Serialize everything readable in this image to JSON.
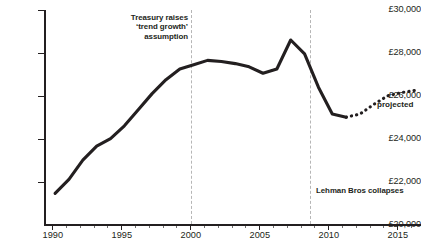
{
  "chart_data": {
    "type": "line",
    "title": "",
    "subtitle": "",
    "xlabel": "",
    "ylabel": "",
    "currency_prefix": "£",
    "xlim": [
      1989.2,
      2016.4
    ],
    "ylim": [
      20000,
      30000
    ],
    "grid": false,
    "legend": "none",
    "y_ticks": [
      {
        "value": 30000,
        "label": "£30,000"
      },
      {
        "value": 28000,
        "label": "£28,000"
      },
      {
        "value": 26000,
        "label": "£26,000"
      },
      {
        "value": 24000,
        "label": "£24,000"
      },
      {
        "value": 22000,
        "label": "£22,000"
      },
      {
        "value": 20000,
        "label": "£20,000"
      }
    ],
    "x_ticks_major": [
      {
        "value": 1990,
        "label": "1990"
      },
      {
        "value": 1995,
        "label": "1995"
      },
      {
        "value": 2000,
        "label": "2000"
      },
      {
        "value": 2005,
        "label": "2005"
      },
      {
        "value": 2010,
        "label": "2010"
      },
      {
        "value": 2015,
        "label": "2015"
      }
    ],
    "x_ticks_minor": [
      1991,
      1992,
      1993,
      1994,
      1996,
      1997,
      1998,
      1999,
      2001,
      2002,
      2003,
      2004,
      2006,
      2007,
      2008,
      2009,
      2011,
      2012,
      2013,
      2014,
      2016
    ],
    "series": [
      {
        "name": "actual",
        "style": "solid",
        "color": "#231f20",
        "x": [
          1990,
          1991,
          1992,
          1993,
          1994,
          1995,
          1996,
          1997,
          1998,
          1999,
          2000,
          2001,
          2002,
          2003,
          2004,
          2005,
          2006,
          2007,
          2008,
          2009,
          2010,
          2011
        ],
        "values": [
          21450,
          22100,
          23000,
          23650,
          24000,
          24600,
          25350,
          26100,
          26750,
          27250,
          27450,
          27650,
          27600,
          27500,
          27350,
          27050,
          27250,
          28600,
          27950,
          26400,
          25150,
          25000
        ]
      },
      {
        "name": "projected",
        "style": "dotted",
        "color": "#231f20",
        "x": [
          2011,
          2012,
          2013,
          2014,
          2015,
          2016
        ],
        "values": [
          25000,
          25150,
          25600,
          26000,
          26150,
          26250
        ]
      }
    ],
    "annotations": [
      {
        "name": "treasury",
        "text": "Treasury raises\n‘trend growth’\nassumption",
        "at_x": 2000,
        "line": "dashed"
      },
      {
        "name": "lehman",
        "text": "Lehman Bros collapses",
        "at_x": 2008.6,
        "line": "dashed"
      },
      {
        "name": "projected",
        "text": "projected",
        "at_x": 2014.4
      }
    ],
    "event_lines": [
      {
        "name": "treasury-2000-line",
        "value": 2000
      },
      {
        "name": "lehman-2008-line",
        "value": 2008.6
      }
    ]
  }
}
